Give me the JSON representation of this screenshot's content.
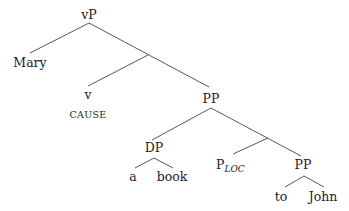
{
  "diagram": {
    "type": "syntax-tree",
    "nodes": {
      "root": "vP",
      "specifier": "Mary",
      "v_head": "v",
      "v_feature": "CAUSE",
      "pp_upper": "PP",
      "dp": "DP",
      "det": "a",
      "noun": "book",
      "p_loc_base": "P",
      "p_loc_sub": "LOC",
      "pp_lower": "PP",
      "prep": "to",
      "object": "John"
    },
    "colors": {
      "text": "#222222",
      "edges": "#444444",
      "background": "#ffffff"
    }
  }
}
